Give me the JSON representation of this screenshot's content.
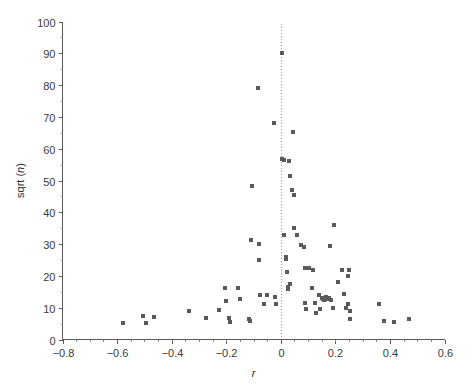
{
  "figure": {
    "background_color": "#ffffff",
    "marker_color": "#5a5a5a",
    "axis_color": "#5b5b5b",
    "reference_line_color": "#9a9a9a"
  },
  "axes": {
    "x_title": "r",
    "y_title_prefix": "sqrt (",
    "y_title_italic": "n",
    "y_title_suffix": ")",
    "x_tick_labels": [
      "−0.8",
      "−0.6",
      "−0.4",
      "−0.2",
      "0",
      "0.2",
      "0.4",
      "0.6"
    ],
    "x_tick_values": [
      -0.8,
      -0.6,
      -0.4,
      -0.2,
      0,
      0.2,
      0.4,
      0.6
    ],
    "y_tick_labels": [
      "0",
      "10",
      "20",
      "30",
      "40",
      "50",
      "60",
      "70",
      "80",
      "90",
      "100"
    ],
    "y_tick_values": [
      0,
      10,
      20,
      30,
      40,
      50,
      60,
      70,
      80,
      90,
      100
    ],
    "x_minor_step": 0.05,
    "y_minor_step": 5
  },
  "chart_data": {
    "type": "scatter",
    "title": "",
    "xlabel": "r",
    "ylabel": "sqrt (n)",
    "xlim": [
      -0.8,
      0.6
    ],
    "ylim": [
      0,
      100
    ],
    "grid": false,
    "legend": null,
    "annotations": [
      {
        "type": "vertical-reference-line",
        "x": 0,
        "style": "dotted",
        "label": ""
      }
    ],
    "marker": {
      "shape": "square",
      "size_px": 4,
      "color": "#5a5a5a"
    },
    "points": [
      {
        "x": -0.58,
        "y": 5.2
      },
      {
        "x": -0.505,
        "y": 7.4
      },
      {
        "x": -0.495,
        "y": 5.1
      },
      {
        "x": -0.465,
        "y": 7.1
      },
      {
        "x": -0.335,
        "y": 9.1
      },
      {
        "x": -0.275,
        "y": 6.8
      },
      {
        "x": -0.225,
        "y": 9.2
      },
      {
        "x": -0.205,
        "y": 16.3
      },
      {
        "x": -0.2,
        "y": 12.0
      },
      {
        "x": -0.19,
        "y": 6.9
      },
      {
        "x": -0.185,
        "y": 5.4
      },
      {
        "x": -0.155,
        "y": 16.1
      },
      {
        "x": -0.15,
        "y": 12.8
      },
      {
        "x": -0.115,
        "y": 6.5
      },
      {
        "x": -0.113,
        "y": 5.9
      },
      {
        "x": -0.11,
        "y": 31.2
      },
      {
        "x": -0.105,
        "y": 48.3
      },
      {
        "x": -0.085,
        "y": 79.0
      },
      {
        "x": -0.08,
        "y": 30.1
      },
      {
        "x": -0.08,
        "y": 24.9
      },
      {
        "x": -0.075,
        "y": 14.1
      },
      {
        "x": -0.06,
        "y": 11.2
      },
      {
        "x": -0.05,
        "y": 14.0
      },
      {
        "x": -0.025,
        "y": 68.0
      },
      {
        "x": -0.02,
        "y": 13.4
      },
      {
        "x": -0.018,
        "y": 11.1
      },
      {
        "x": 0.005,
        "y": 90.2
      },
      {
        "x": 0.005,
        "y": 56.9
      },
      {
        "x": 0.012,
        "y": 56.5
      },
      {
        "x": 0.012,
        "y": 33.0
      },
      {
        "x": 0.018,
        "y": 25.9
      },
      {
        "x": 0.02,
        "y": 25.3
      },
      {
        "x": 0.022,
        "y": 21.3
      },
      {
        "x": 0.025,
        "y": 16.4
      },
      {
        "x": 0.028,
        "y": 15.8
      },
      {
        "x": 0.03,
        "y": 56.0
      },
      {
        "x": 0.032,
        "y": 17.5
      },
      {
        "x": 0.035,
        "y": 51.5
      },
      {
        "x": 0.04,
        "y": 47.0
      },
      {
        "x": 0.045,
        "y": 65.3
      },
      {
        "x": 0.048,
        "y": 45.3
      },
      {
        "x": 0.05,
        "y": 35.0
      },
      {
        "x": 0.06,
        "y": 33.0
      },
      {
        "x": 0.075,
        "y": 29.6
      },
      {
        "x": 0.085,
        "y": 29.0
      },
      {
        "x": 0.088,
        "y": 22.4
      },
      {
        "x": 0.09,
        "y": 11.5
      },
      {
        "x": 0.092,
        "y": 9.6
      },
      {
        "x": 0.105,
        "y": 22.5
      },
      {
        "x": 0.115,
        "y": 16.3
      },
      {
        "x": 0.118,
        "y": 21.9
      },
      {
        "x": 0.125,
        "y": 11.5
      },
      {
        "x": 0.13,
        "y": 8.3
      },
      {
        "x": 0.14,
        "y": 13.9
      },
      {
        "x": 0.145,
        "y": 9.6
      },
      {
        "x": 0.15,
        "y": 13.2
      },
      {
        "x": 0.155,
        "y": 12.6
      },
      {
        "x": 0.16,
        "y": 12.5
      },
      {
        "x": 0.165,
        "y": 13.4
      },
      {
        "x": 0.17,
        "y": 12.8
      },
      {
        "x": 0.175,
        "y": 13.2
      },
      {
        "x": 0.18,
        "y": 29.3
      },
      {
        "x": 0.185,
        "y": 12.4
      },
      {
        "x": 0.19,
        "y": 9.9
      },
      {
        "x": 0.195,
        "y": 36.0
      },
      {
        "x": 0.21,
        "y": 18.1
      },
      {
        "x": 0.225,
        "y": 22.0
      },
      {
        "x": 0.232,
        "y": 14.2
      },
      {
        "x": 0.24,
        "y": 10.0
      },
      {
        "x": 0.245,
        "y": 11.1
      },
      {
        "x": 0.248,
        "y": 19.9
      },
      {
        "x": 0.25,
        "y": 21.8
      },
      {
        "x": 0.252,
        "y": 9.0
      },
      {
        "x": 0.255,
        "y": 6.5
      },
      {
        "x": 0.36,
        "y": 11.1
      },
      {
        "x": 0.38,
        "y": 5.8
      },
      {
        "x": 0.415,
        "y": 5.6
      },
      {
        "x": 0.47,
        "y": 6.5
      }
    ]
  }
}
